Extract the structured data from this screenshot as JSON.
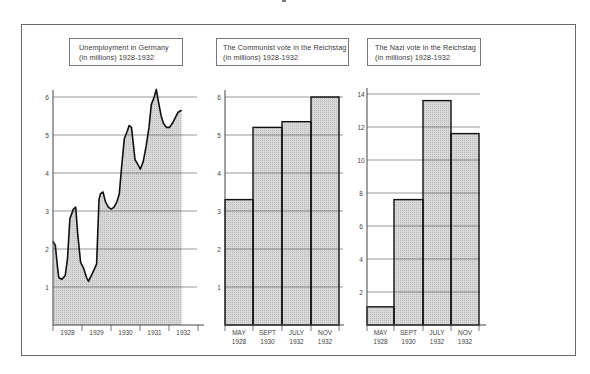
{
  "chart_data": [
    {
      "type": "area",
      "title": "Unemployment in Germany",
      "subtitle": "(in millions) 1928-1932",
      "xlabel": "",
      "ylabel": "millions",
      "ylim": [
        0,
        6.2
      ],
      "yticks": [
        1,
        2,
        3,
        4,
        5,
        6
      ],
      "categories": [
        "1928",
        "1929",
        "1930",
        "1931",
        "1932"
      ],
      "grid": true,
      "series": [
        {
          "name": "Unemployed (millions)",
          "x": [
            1928.0,
            1928.08,
            1928.15,
            1928.2,
            1928.3,
            1928.42,
            1928.5,
            1928.58,
            1928.7,
            1928.78,
            1928.85,
            1928.95,
            1929.05,
            1929.15,
            1929.22,
            1929.35,
            1929.5,
            1929.58,
            1929.63,
            1929.72,
            1929.8,
            1929.9,
            1930.0,
            1930.1,
            1930.2,
            1930.28,
            1930.35,
            1930.45,
            1930.55,
            1930.62,
            1930.7,
            1930.82,
            1930.9,
            1931.0,
            1931.1,
            1931.2,
            1931.3,
            1931.38,
            1931.48,
            1931.55,
            1931.63,
            1931.72,
            1931.8,
            1931.9,
            1932.0,
            1932.1,
            1932.2,
            1932.3,
            1932.42
          ],
          "values": [
            2.2,
            2.1,
            1.55,
            1.25,
            1.2,
            1.3,
            1.75,
            2.8,
            3.05,
            3.1,
            2.4,
            1.65,
            1.5,
            1.25,
            1.15,
            1.35,
            1.6,
            3.3,
            3.45,
            3.5,
            3.25,
            3.1,
            3.05,
            3.1,
            3.25,
            3.45,
            4.1,
            4.9,
            5.1,
            5.25,
            5.2,
            4.35,
            4.25,
            4.1,
            4.3,
            4.7,
            5.2,
            5.8,
            6.0,
            6.2,
            5.85,
            5.5,
            5.3,
            5.2,
            5.2,
            5.3,
            5.45,
            5.6,
            5.65
          ]
        }
      ]
    },
    {
      "type": "bar",
      "title": "The Communist vote in the Reichstag",
      "subtitle": "(in millions) 1928-1932",
      "xlabel": "",
      "ylabel": "millions",
      "ylim": [
        0,
        6.2
      ],
      "yticks": [
        1,
        2,
        3,
        4,
        5,
        6
      ],
      "categories": [
        "MAY 1928",
        "SEPT 1930",
        "JULY 1932",
        "NOV 1932"
      ],
      "category_lines": [
        [
          "MAY",
          "1928"
        ],
        [
          "SEPT",
          "1930"
        ],
        [
          "JULY",
          "1932"
        ],
        [
          "NOV",
          "1932"
        ]
      ],
      "values": [
        3.3,
        5.2,
        5.35,
        6.0
      ],
      "grid": true
    },
    {
      "type": "bar",
      "title": "The Nazi vote in the Reichstag",
      "subtitle": "(in millions) 1928-1932",
      "xlabel": "",
      "ylabel": "millions",
      "ylim": [
        0,
        14.2
      ],
      "yticks": [
        2,
        4,
        6,
        8,
        10,
        12,
        14
      ],
      "categories": [
        "MAY 1928",
        "SEPT 1930",
        "JULY 1932",
        "NOV 1932"
      ],
      "category_lines": [
        [
          "MAY",
          "1928"
        ],
        [
          "SEPT",
          "1930"
        ],
        [
          "JULY",
          "1932"
        ],
        [
          "NOV",
          "1932"
        ]
      ],
      "values": [
        1.1,
        7.6,
        13.6,
        11.6
      ],
      "grid": true
    }
  ],
  "colors": {
    "fill": "#d4d4d4",
    "line": "#111111",
    "grid": "#555555",
    "axis": "#444444",
    "frame": "#6a6a6a"
  }
}
